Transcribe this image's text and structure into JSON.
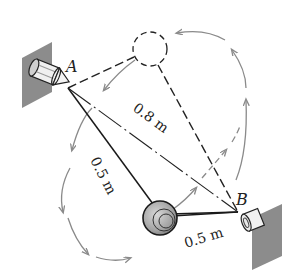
{
  "diagram": {
    "type": "mechanics-pendulum",
    "points": {
      "A": {
        "label": "A"
      },
      "B": {
        "label": "B"
      }
    },
    "dimensions": {
      "AB": "0.8 m",
      "A_to_ball": "0.5 m",
      "ball_to_B": "0.5 m"
    },
    "elements": [
      "wall-support-A",
      "wall-support-B",
      "ball",
      "ball-ghost-position",
      "motion-path-arrows"
    ],
    "colors": {
      "line": "#1a1a1a",
      "wall": "#8c8c8c",
      "path_arrow": "#8a8a8a",
      "ball": "#a8a8a8"
    }
  }
}
